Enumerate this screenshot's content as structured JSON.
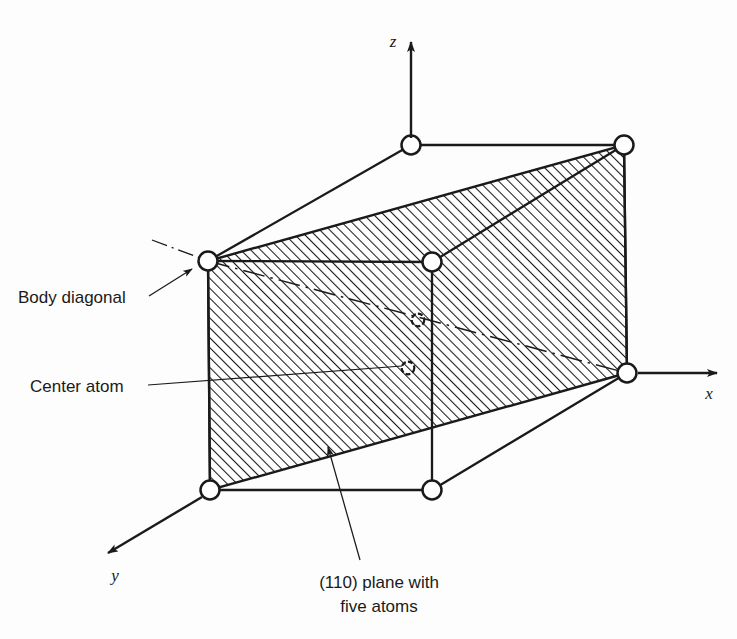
{
  "figure": {
    "background_color": "#fdfdfd",
    "line_color": "#1a1a1a",
    "hatch_color": "#1a1a1a",
    "atom_fill": "#ffffff"
  },
  "axes": {
    "z_label": "z",
    "x_label": "x",
    "y_label": "y"
  },
  "labels": {
    "body_diagonal": "Body diagonal",
    "center_atom": "Center atom"
  },
  "caption": {
    "line1": "(110) plane with",
    "line2": "five atoms"
  },
  "atoms": {
    "corner_count": 6,
    "center_count": 1,
    "plane_atom_count": "five atoms"
  },
  "geometry": {
    "vertices": {
      "top_back_left": [
        411,
        145
      ],
      "top_back_right": [
        624,
        145
      ],
      "top_front_left": [
        208,
        261
      ],
      "top_front_right": [
        432,
        262
      ],
      "bottom_front_left": [
        210,
        490
      ],
      "bottom_front_right": [
        432,
        490
      ],
      "bottom_back_right": [
        627,
        373
      ],
      "center_upper": [
        418,
        320
      ],
      "center_lower": [
        408,
        368
      ]
    }
  }
}
